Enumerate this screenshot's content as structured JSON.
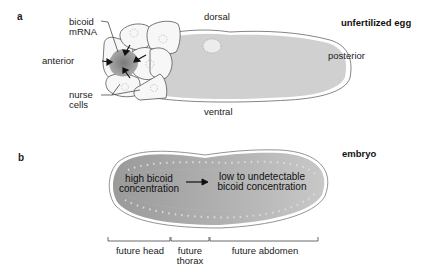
{
  "panel_a": {
    "letter": "a",
    "title": "unfertilized egg",
    "labels": {
      "bicoid_line1": "bicoid",
      "bicoid_line2": "mRNA",
      "anterior": "anterior",
      "dorsal": "dorsal",
      "ventral": "ventral",
      "posterior": "posterior",
      "nurse_line1": "nurse",
      "nurse_line2": "cells"
    }
  },
  "panel_b": {
    "letter": "b",
    "title": "embryo",
    "gradient": {
      "high_line1": "high bicoid",
      "high_line2": "concentration",
      "low_line1": "low to undetectable",
      "low_line2": "bicoid concentration"
    },
    "regions": [
      {
        "line1": "future head",
        "line2": ""
      },
      {
        "line1": "future",
        "line2": "thorax"
      },
      {
        "line1": "future abdomen",
        "line2": ""
      }
    ]
  },
  "colors": {
    "egg_fill": "#cfcfcf",
    "embryo_fill_dark": "#9f9f9f",
    "embryo_fill_light": "#c4c4c4",
    "mrna": "#8c8c8c",
    "outline": "#555555"
  }
}
